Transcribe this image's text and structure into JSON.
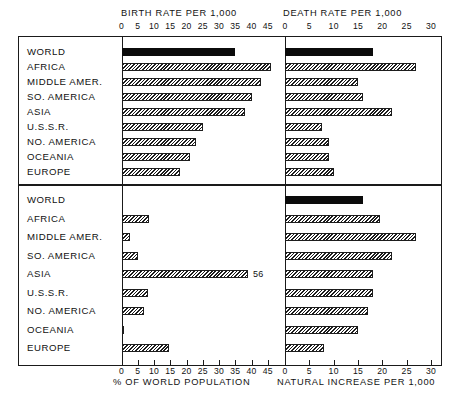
{
  "chart_data": {
    "type": "bar",
    "title": "",
    "layout": "2x2 grouped horizontal bar panels, shared category rows",
    "categories": [
      "WORLD",
      "AFRICA",
      "MIDDLE AMER.",
      "SO. AMERICA",
      "ASIA",
      "U.S.S.R.",
      "NO. AMERICA",
      "OCEANIA",
      "EUROPE"
    ],
    "grid": false,
    "legend": "none",
    "highlight_note": "WORLD row drawn solid black; all other rows drawn with diagonal hatch fill",
    "panels": [
      {
        "id": "birth-rate",
        "position": "top-left",
        "title": "BIRTH RATE PER 1,000",
        "title_position": "top",
        "xlabel": "BIRTH RATE PER 1,000",
        "ylabel": "",
        "xlim": [
          0,
          45
        ],
        "xticks": [
          0,
          5,
          10,
          15,
          20,
          25,
          30,
          35,
          40,
          45
        ],
        "values": [
          35,
          46,
          43,
          40,
          38,
          25,
          23,
          21,
          18
        ],
        "data_labels": []
      },
      {
        "id": "death-rate",
        "position": "top-right",
        "title": "DEATH RATE PER 1,000",
        "title_position": "top",
        "xlabel": "DEATH RATE PER 1,000",
        "ylabel": "",
        "xlim": [
          0,
          30
        ],
        "xticks": [
          0,
          5,
          10,
          15,
          20,
          25,
          30
        ],
        "values": [
          18,
          27,
          15,
          16,
          22,
          7.5,
          9,
          9,
          10
        ],
        "data_labels": []
      },
      {
        "id": "percent-world-population",
        "position": "bottom-left",
        "title": "% OF WORLD POPULATION",
        "title_position": "bottom",
        "xlabel": "% OF WORLD POPULATION",
        "ylabel": "",
        "xlim": [
          0,
          45
        ],
        "xticks": [
          0,
          5,
          10,
          15,
          20,
          25,
          30,
          35,
          40,
          45
        ],
        "values": [
          0,
          8.5,
          2.5,
          5,
          56,
          8,
          7,
          0.5,
          14.5
        ],
        "data_labels": [
          {
            "category": "ASIA",
            "value": 56,
            "text": "56",
            "note": "bar is clipped at panel edge; value printed beside bar"
          }
        ]
      },
      {
        "id": "natural-increase",
        "position": "bottom-right",
        "title": "NATURAL INCREASE PER 1,000",
        "title_position": "bottom",
        "xlabel": "NATURAL INCREASE PER 1,000",
        "ylabel": "",
        "xlim": [
          0,
          30
        ],
        "xticks": [
          0,
          5,
          10,
          15,
          20,
          25,
          30
        ],
        "values": [
          16,
          19.5,
          27,
          22,
          18,
          18,
          17,
          15,
          8
        ],
        "data_labels": []
      }
    ]
  },
  "axes": {
    "birth_title": "BIRTH RATE PER 1,000",
    "death_title": "DEATH RATE PER 1,000",
    "population_title": "% OF WORLD POPULATION",
    "increase_title": "NATURAL INCREASE PER 1,000"
  },
  "ticks": {
    "left": [
      "0",
      "5",
      "10",
      "15",
      "20",
      "25",
      "30",
      "35",
      "40",
      "45"
    ],
    "right": [
      "0",
      "5",
      "10",
      "15",
      "20",
      "25",
      "30"
    ]
  },
  "rows": {
    "r0": "WORLD",
    "r1": "AFRICA",
    "r2": "MIDDLE AMER.",
    "r3": "SO. AMERICA",
    "r4": "ASIA",
    "r5": "U.S.S.R.",
    "r6": "NO. AMERICA",
    "r7": "OCEANIA",
    "r8": "EUROPE"
  },
  "labels": {
    "asia_population_value": "56"
  },
  "colors": {
    "ink": "#1a1a1a",
    "solid_bar": "#0b0b0b",
    "paper": "#ffffff"
  }
}
